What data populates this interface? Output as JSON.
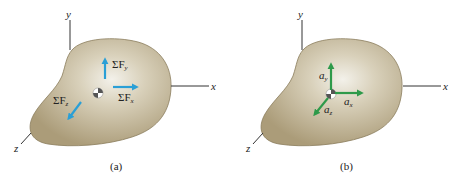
{
  "panels": [
    {
      "id": "a",
      "caption": "(a)",
      "axes": {
        "x": "x",
        "y": "y",
        "z": "z"
      },
      "vectors": [
        {
          "name": "sum-force-y",
          "label_prefix": "ΣF",
          "subscript": "y",
          "direction": "up"
        },
        {
          "name": "sum-force-x",
          "label_prefix": "ΣF",
          "subscript": "x",
          "direction": "right"
        },
        {
          "name": "sum-force-z",
          "label_prefix": "ΣF",
          "subscript": "z",
          "direction": "down-left"
        }
      ],
      "vector_color": "#2a9fd6"
    },
    {
      "id": "b",
      "caption": "(b)",
      "axes": {
        "x": "x",
        "y": "y",
        "z": "z"
      },
      "vectors": [
        {
          "name": "accel-y",
          "label_prefix": "a",
          "subscript": "y",
          "direction": "up"
        },
        {
          "name": "accel-x",
          "label_prefix": "a",
          "subscript": "x",
          "direction": "right"
        },
        {
          "name": "accel-z",
          "label_prefix": "a",
          "subscript": "z",
          "direction": "down-left"
        }
      ],
      "vector_color": "#2e9a4a"
    }
  ],
  "colors": {
    "body_fill_center": "#efece3",
    "body_fill_edge": "#b3a583",
    "body_outline": "#8a7c5c"
  }
}
